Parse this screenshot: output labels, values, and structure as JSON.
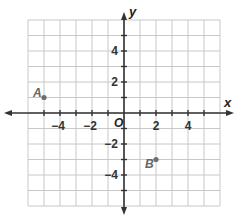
{
  "chart_data": {
    "type": "scatter",
    "title": "",
    "xlabel": "x",
    "ylabel": "y",
    "xlim": [
      -6,
      6
    ],
    "ylim": [
      -6,
      6
    ],
    "grid": true,
    "origin_label": "O",
    "x_ticks": [
      -4,
      -2,
      2,
      4
    ],
    "y_ticks": [
      4,
      2,
      -2,
      -4
    ],
    "x_tick_labels": [
      "−4",
      "−2",
      "2",
      "4"
    ],
    "y_tick_labels": [
      "4",
      "2",
      "−2",
      "−4"
    ],
    "points": [
      {
        "label": "A",
        "x": -5,
        "y": 1
      },
      {
        "label": "B",
        "x": 2,
        "y": -3
      }
    ]
  },
  "colors": {
    "grid": "#c8c8c8",
    "axis": "#333333",
    "point": "#6e6e6e",
    "point_label": "#666666"
  }
}
